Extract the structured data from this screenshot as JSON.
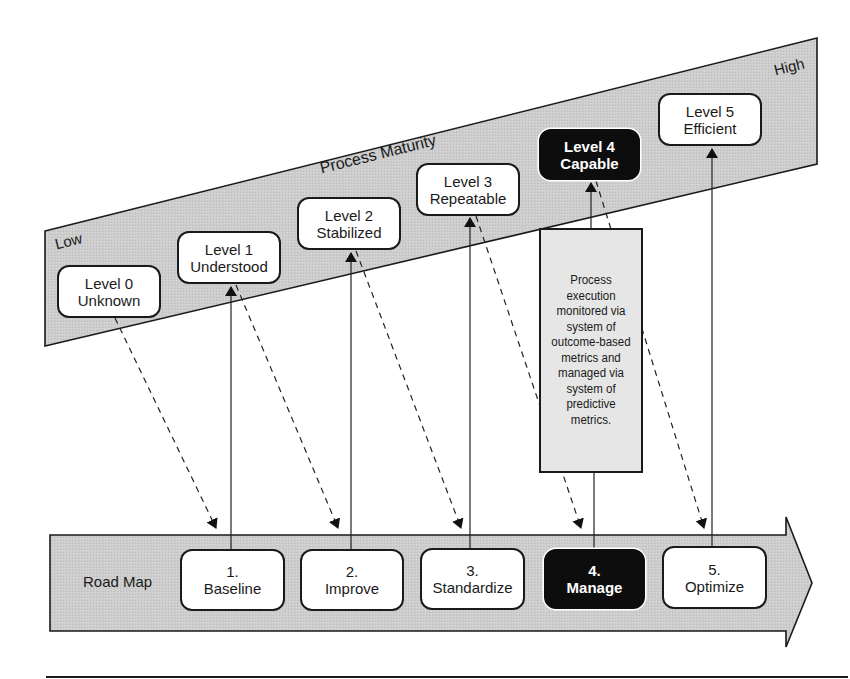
{
  "diagram": {
    "maturity_band": {
      "title": "Process Maturity",
      "low_label": "Low",
      "high_label": "High",
      "levels": [
        {
          "line1": "Level 0",
          "line2": "Unknown",
          "highlighted": false
        },
        {
          "line1": "Level 1",
          "line2": "Understood",
          "highlighted": false
        },
        {
          "line1": "Level 2",
          "line2": "Stabilized",
          "highlighted": false
        },
        {
          "line1": "Level 3",
          "line2": "Repeatable",
          "highlighted": false
        },
        {
          "line1": "Level 4",
          "line2": "Capable",
          "highlighted": true
        },
        {
          "line1": "Level 5",
          "line2": "Efficient",
          "highlighted": false
        }
      ]
    },
    "road_map": {
      "label": "Road Map",
      "steps": [
        {
          "number": "1.",
          "name": "Baseline",
          "highlighted": false
        },
        {
          "number": "2.",
          "name": "Improve",
          "highlighted": false
        },
        {
          "number": "3.",
          "name": "Standardize",
          "highlighted": false
        },
        {
          "number": "4.",
          "name": "Manage",
          "highlighted": true
        },
        {
          "number": "5.",
          "name": "Optimize",
          "highlighted": false
        }
      ]
    },
    "description": "Process execution monitored via system of outcome-based metrics and managed via system of predictive metrics.",
    "colors": {
      "band_fill": "#cfcfcf",
      "outline": "#1a1a1a",
      "highlight_fill": "#0d0d0d",
      "description_fill": "#e6e6e6",
      "box_fill": "#ffffff"
    }
  }
}
